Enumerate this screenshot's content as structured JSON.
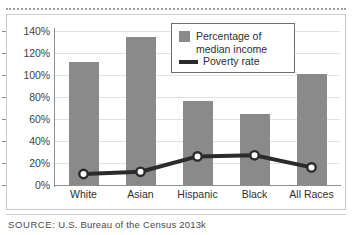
{
  "chart_data": {
    "type": "bar",
    "title": "",
    "subtitle": "",
    "xlabel": "",
    "ylabel": "",
    "ylim": [
      0,
      140
    ],
    "ytick_step": 20,
    "ytick_labels": [
      "0%",
      "20%",
      "40%",
      "60%",
      "80%",
      "100%",
      "120%",
      "140%"
    ],
    "ytick_values": [
      0,
      20,
      40,
      60,
      80,
      100,
      120,
      140
    ],
    "grid": true,
    "legend_position": "top-right",
    "categories": [
      "White",
      "Asian",
      "Hispanic",
      "Black",
      "All Races"
    ],
    "series": [
      {
        "name": "Percentage of median income",
        "type": "bar",
        "color": "#8a8a8a",
        "values": [
          112,
          135,
          76,
          65,
          101
        ]
      },
      {
        "name": "Poverty rate",
        "type": "line",
        "color": "#2b2b2b",
        "marker": "circle-white-fill",
        "values": [
          10,
          12,
          26,
          27,
          16
        ]
      }
    ],
    "annotations": []
  },
  "legend": {
    "items": [
      {
        "label": "Percentage of\nmedian income",
        "marker": "square-swatch",
        "color": "#8a8a8a"
      },
      {
        "label": "Poverty rate",
        "marker": "line-swatch",
        "color": "#2b2b2b"
      }
    ]
  },
  "footer": {
    "source_label": "SOURCE:",
    "source_text": "U.S. Bureau of the Census 2013k"
  },
  "colors": {
    "bar": "#8a8a8a",
    "line": "#2b2b2b",
    "grid": "#e2e2e2",
    "axis": "#8e8e8e",
    "frame": "#c9c9c9",
    "text": "#2f2f2f"
  }
}
